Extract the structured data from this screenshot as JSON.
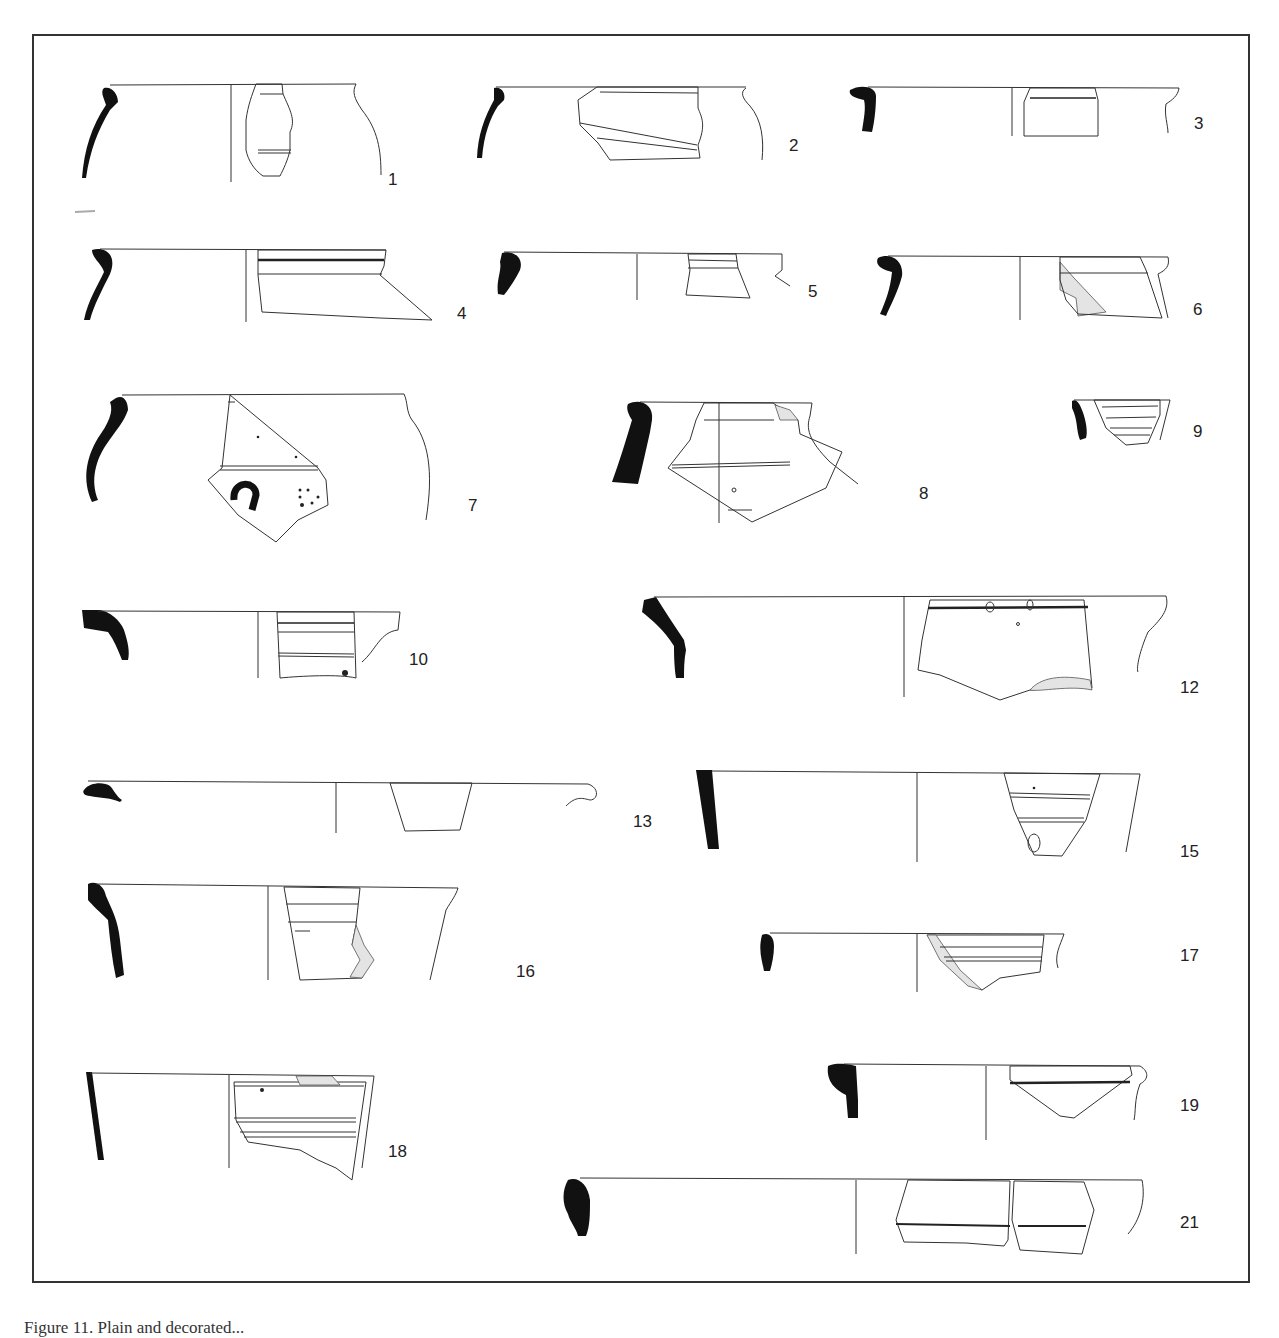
{
  "plate": {
    "caption": "Figure 11. Plain and decorated...",
    "border_color": "#333333",
    "figures": [
      {
        "id": "1",
        "label": "1"
      },
      {
        "id": "2",
        "label": "2"
      },
      {
        "id": "3",
        "label": "3"
      },
      {
        "id": "4",
        "label": "4"
      },
      {
        "id": "5",
        "label": "5"
      },
      {
        "id": "6",
        "label": "6"
      },
      {
        "id": "7",
        "label": "7"
      },
      {
        "id": "8",
        "label": "8"
      },
      {
        "id": "9",
        "label": "9"
      },
      {
        "id": "10",
        "label": "10"
      },
      {
        "id": "12",
        "label": "12"
      },
      {
        "id": "13",
        "label": "13"
      },
      {
        "id": "15",
        "label": "15"
      },
      {
        "id": "16",
        "label": "16"
      },
      {
        "id": "17",
        "label": "17"
      },
      {
        "id": "18",
        "label": "18"
      },
      {
        "id": "19",
        "label": "19"
      },
      {
        "id": "21",
        "label": "21"
      }
    ]
  }
}
